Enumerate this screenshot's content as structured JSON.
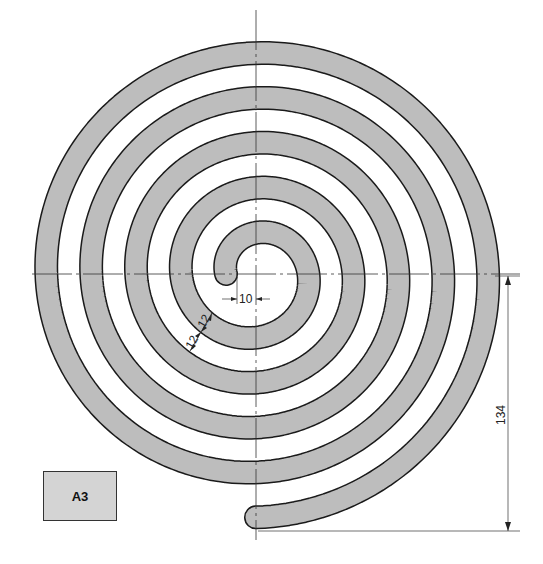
{
  "drawing": {
    "title_block": {
      "label": "A3"
    },
    "center": {
      "x": 256,
      "y": 274
    },
    "spiral": {
      "type": "archimedean",
      "r0": 7.5,
      "growth_per_radian": 7.15,
      "theta_start_pi": 1.0,
      "theta_end_pi": 10.5,
      "band_width_px": 22,
      "fill_color": "#bdbdbd",
      "outline_color": "#1a1a1a"
    },
    "dimensions": {
      "inner_gap": {
        "value": "10"
      },
      "band_width": {
        "value": "12"
      },
      "gap_width": {
        "value": "12"
      },
      "overall_height": {
        "value": "134"
      }
    },
    "axes": {
      "horizontal": {
        "y": 274,
        "x1": 32,
        "x2": 520
      },
      "vertical": {
        "x": 256,
        "y1": 10,
        "y2": 540
      }
    }
  }
}
